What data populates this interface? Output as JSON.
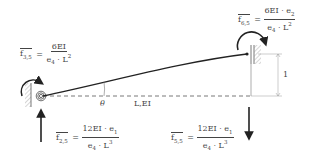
{
  "diagram": {
    "beam_label": "L,EI",
    "angle_label": "θ",
    "unit_displacement_label": "1",
    "forces": [
      {
        "id": "f35",
        "symbol": "f",
        "subscript": "3,5",
        "numerator": "6EI",
        "denominator": "e4 · L2",
        "den_parts": [
          "e",
          "4",
          " · L",
          "2"
        ]
      },
      {
        "id": "f65",
        "symbol": "f",
        "subscript": "6,5",
        "numerator": "6EI · e2",
        "num_parts": [
          "6EI · e",
          "2"
        ],
        "denominator": "e4 · L2",
        "den_parts": [
          "e",
          "4",
          " · L",
          "2"
        ]
      },
      {
        "id": "f25",
        "symbol": "f",
        "subscript": "2,5",
        "numerator": "12EI · e1",
        "num_parts": [
          "12EI · e",
          "1"
        ],
        "denominator": "e4 · L3",
        "den_parts": [
          "e",
          "4",
          " · L",
          "3"
        ]
      },
      {
        "id": "f55",
        "symbol": "f",
        "subscript": "5,5",
        "numerator": "12EI · e1",
        "num_parts": [
          "12EI · e",
          "1"
        ],
        "denominator": "e4 · L3",
        "den_parts": [
          "e",
          "4",
          " · L",
          "3"
        ]
      }
    ],
    "colors": {
      "line": "#222222",
      "hatch": "#888888",
      "text": "#444444"
    }
  }
}
